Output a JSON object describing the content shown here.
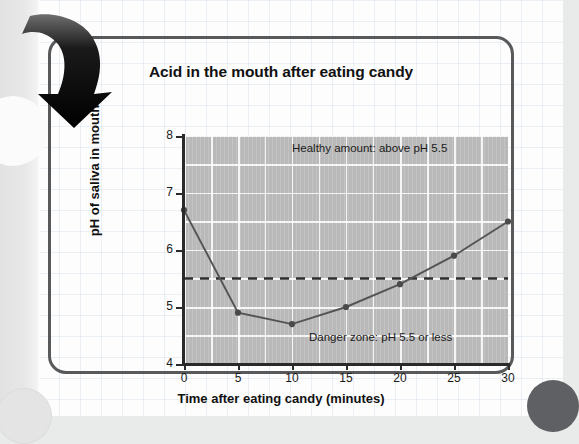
{
  "chart_data": {
    "type": "line",
    "title": "Acid in the mouth after eating candy",
    "xlabel": "Time after eating candy (minutes)",
    "ylabel": "pH of saliva in mouth",
    "x": [
      0,
      5,
      10,
      15,
      20,
      25,
      30
    ],
    "values": [
      6.7,
      4.9,
      4.7,
      5.0,
      5.4,
      5.9,
      6.5
    ],
    "xlim": [
      0,
      30
    ],
    "ylim": [
      4,
      8
    ],
    "xticks": [
      "0",
      "5",
      "10",
      "15",
      "20",
      "25",
      "30"
    ],
    "yticks": [
      "4",
      "5",
      "6",
      "7",
      "8"
    ],
    "grid": true,
    "legend": "none",
    "threshold": {
      "value": 5.5,
      "style": "dashed",
      "label_above": "Healthy amount: above pH 5.5",
      "label_below": "Danger zone: pH 5.5 or less"
    },
    "colors": {
      "plot_background": "#b9b9b9",
      "gridline": "#ffffff",
      "line": "#545454",
      "marker": "#4a4a4a",
      "threshold_line": "#2e2e2e",
      "axis": "#2a2a2a",
      "card_border": "#58595b"
    }
  },
  "annotations": {
    "healthy": "Healthy amount: above pH 5.5",
    "danger": "Danger zone: pH 5.5 or less"
  },
  "decor": {
    "arrow_name": "curved-down-arrow",
    "arrow_color": "#0a0a0a"
  }
}
